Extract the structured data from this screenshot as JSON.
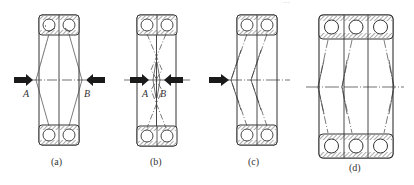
{
  "figure": {
    "top_text_cut_off": "…",
    "panels": [
      {
        "id": "a",
        "caption": "(a)",
        "arrangement": "back-to-back, two bearings",
        "points": [
          "A",
          "B"
        ],
        "arrows": "outer, pointing inward"
      },
      {
        "id": "b",
        "caption": "(b)",
        "arrangement": "face-to-face, two bearings",
        "points": [
          "A",
          "B"
        ],
        "arrows": "near center, pointing inward"
      },
      {
        "id": "c",
        "caption": "(c)",
        "arrangement": "tandem, two bearings",
        "points": [],
        "arrows": "left, pointing right"
      },
      {
        "id": "d",
        "caption": "(d)",
        "arrangement": "three bearings combined",
        "points": [],
        "arrows": "none"
      }
    ]
  },
  "colors": {
    "line": "#3a3a3a",
    "arrow": "#1a1a1a",
    "background": "#ffffff"
  }
}
